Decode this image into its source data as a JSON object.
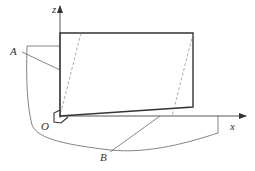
{
  "diagram": {
    "labels": {
      "z_axis": "z",
      "x_axis": "x",
      "origin": "O",
      "part_a": "A",
      "part_b": "B"
    },
    "colors": {
      "line": "#555555",
      "thick_line": "#333333",
      "dashed_line": "#888888",
      "background": "#ffffff"
    }
  }
}
